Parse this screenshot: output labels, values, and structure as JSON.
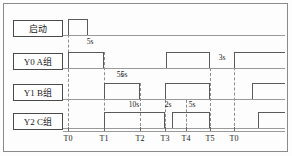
{
  "diagram": {
    "width": 292,
    "height": 156,
    "axis_start_x": 63,
    "axis_end_x": 285,
    "colors": {
      "wire": "#5a5a5a",
      "baseline": "#9a9a9a",
      "grid": "#8d8d8d",
      "text": "#1a1a1a",
      "frame": "#8a8a8a"
    }
  },
  "channels": [
    {
      "key": "start",
      "label": "启动",
      "box_top": 20,
      "baseline_y": 35,
      "pulse_height": 16,
      "pulses": [
        {
          "x1": 68,
          "x2": 88,
          "open_left": false,
          "open_right": false
        }
      ]
    },
    {
      "key": "y0",
      "label": "Y0 A组",
      "box_top": 53,
      "baseline_y": 68,
      "pulse_height": 16,
      "pulses": [
        {
          "x1": 68,
          "x2": 104,
          "open_left": false,
          "open_right": false
        },
        {
          "x1": 166,
          "x2": 210,
          "open_left": false,
          "open_right": false
        },
        {
          "x1": 234,
          "x2": 285,
          "open_left": false,
          "open_right": true
        }
      ]
    },
    {
      "key": "y1",
      "label": "Y1 B组",
      "box_top": 84,
      "baseline_y": 99,
      "pulse_height": 16,
      "pulses": [
        {
          "x1": 104,
          "x2": 140,
          "open_left": false,
          "open_right": false
        },
        {
          "x1": 165,
          "x2": 210,
          "open_left": false,
          "open_right": false
        },
        {
          "x1": 252,
          "x2": 285,
          "open_left": false,
          "open_right": true
        }
      ]
    },
    {
      "key": "y2",
      "label": "Y2 C组",
      "box_top": 113,
      "baseline_y": 128,
      "pulse_height": 16,
      "pulses": [
        {
          "x1": 104,
          "x2": 165,
          "open_left": false,
          "open_right": false
        },
        {
          "x1": 172,
          "x2": 210,
          "open_left": false,
          "open_right": false
        },
        {
          "x1": 258,
          "x2": 285,
          "open_left": false,
          "open_right": true
        }
      ]
    }
  ],
  "time_axis": {
    "y": 131,
    "label_y": 134,
    "marks": [
      {
        "label": "T0",
        "x": 68
      },
      {
        "label": "T1",
        "x": 104
      },
      {
        "label": "T2",
        "x": 140
      },
      {
        "label": "T3",
        "x": 165
      },
      {
        "label": "T4",
        "x": 186
      },
      {
        "label": "T5",
        "x": 210
      },
      {
        "label": "T0",
        "x": 234
      }
    ]
  },
  "gridlines": [
    {
      "x": 68,
      "y1": 20,
      "y2": 131
    },
    {
      "x": 104,
      "y1": 52,
      "y2": 131
    },
    {
      "x": 140,
      "y1": 83,
      "y2": 131
    },
    {
      "x": 165,
      "y1": 100,
      "y2": 131
    },
    {
      "x": 186,
      "y1": 100,
      "y2": 131
    },
    {
      "x": 210,
      "y1": 68,
      "y2": 131
    },
    {
      "x": 234,
      "y1": 52,
      "y2": 131
    }
  ],
  "durations": [
    {
      "text": "5s",
      "x": 90,
      "y": 37,
      "of": "start-pulse-width"
    },
    {
      "text": "5s",
      "x": 120,
      "y": 70,
      "of": "y0-first-pulse"
    },
    {
      "text": "3s",
      "x": 222,
      "y": 53,
      "of": "y0-gap-t5-to-t0"
    },
    {
      "text": "5s",
      "x": 124,
      "y": 70,
      "of": "y1-first-pulse"
    },
    {
      "text": "10s",
      "x": 134,
      "y": 100,
      "of": "y2-first-pulse"
    },
    {
      "text": "2s",
      "x": 168,
      "y": 100,
      "of": "y2-gap-t3-to-t4"
    },
    {
      "text": "5s",
      "x": 192,
      "y": 100,
      "of": "y2-second-pulse"
    }
  ]
}
